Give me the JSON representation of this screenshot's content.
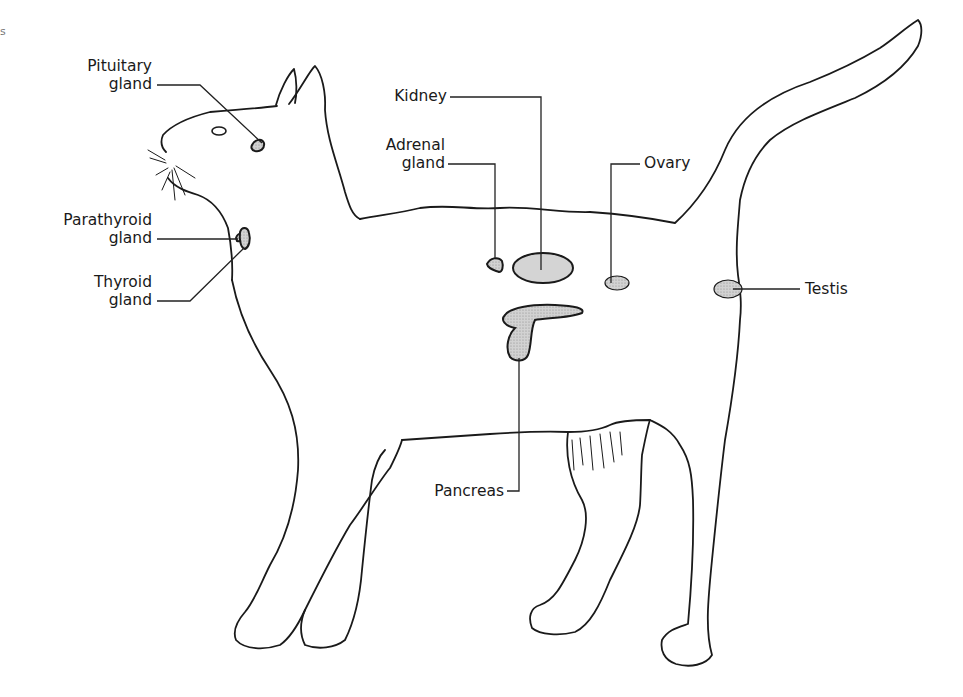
{
  "diagram": {
    "title": "",
    "corner_mark": "s",
    "colors": {
      "outline": "#1a1a1a",
      "organ_fill": "#c9c9c9",
      "organ_fill_dark": "#b5b5b5",
      "background": "#ffffff"
    },
    "labels": {
      "pituitary": {
        "line1": "Pituitary",
        "line2": "gland"
      },
      "parathyroid": {
        "line1": "Parathyroid",
        "line2": "gland"
      },
      "thyroid": {
        "line1": "Thyroid",
        "line2": "gland"
      },
      "kidney": {
        "line1": "Kidney"
      },
      "adrenal": {
        "line1": "Adrenal",
        "line2": "gland"
      },
      "ovary": {
        "line1": "Ovary"
      },
      "testis": {
        "line1": "Testis"
      },
      "pancreas": {
        "line1": "Pancreas"
      }
    }
  }
}
